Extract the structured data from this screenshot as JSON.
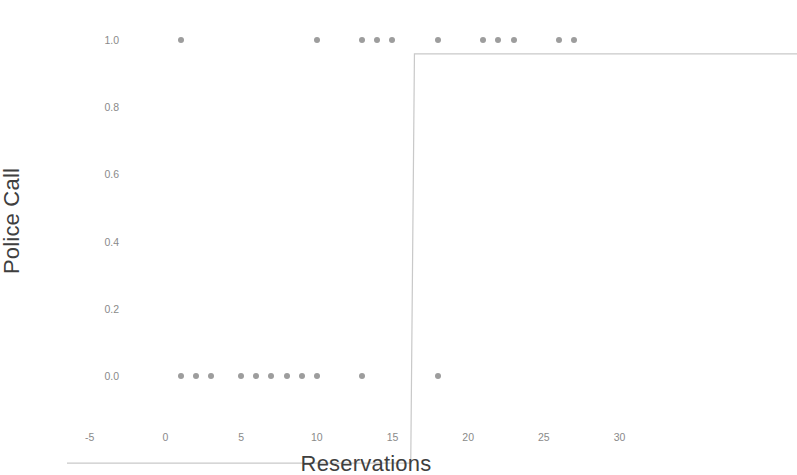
{
  "chart_data": {
    "type": "scatter",
    "title": "",
    "xlabel": "Reservations",
    "ylabel": "Police Call",
    "xlim": [
      -6.5,
      33
    ],
    "ylim": [
      -0.04,
      1.04
    ],
    "xticks": [
      -5,
      0,
      5,
      10,
      15,
      20,
      25,
      30
    ],
    "xtick_labels": [
      "-5",
      "0",
      "5",
      "10",
      "15",
      "20",
      "25",
      "30"
    ],
    "yticks": [
      0.0,
      0.2,
      0.4,
      0.6,
      0.8,
      1.0
    ],
    "ytick_labels": [
      "0.0",
      "0.2",
      "0.4",
      "0.6",
      "0.8",
      "1.0"
    ],
    "grid": false,
    "legend": null,
    "point_color": "#9d9d9d",
    "line_color": "#c9c9c9",
    "series": [
      {
        "name": "Police Call observations",
        "type": "scatter",
        "points": [
          {
            "x": 1,
            "y": 1
          },
          {
            "x": 1,
            "y": 0
          },
          {
            "x": 2,
            "y": 0
          },
          {
            "x": 3,
            "y": 0
          },
          {
            "x": 5,
            "y": 0
          },
          {
            "x": 6,
            "y": 0
          },
          {
            "x": 7,
            "y": 0
          },
          {
            "x": 8,
            "y": 0
          },
          {
            "x": 9,
            "y": 0
          },
          {
            "x": 10,
            "y": 0
          },
          {
            "x": 10,
            "y": 1
          },
          {
            "x": 13,
            "y": 0
          },
          {
            "x": 13,
            "y": 1
          },
          {
            "x": 14,
            "y": 1
          },
          {
            "x": 15,
            "y": 1
          },
          {
            "x": 18,
            "y": 0
          },
          {
            "x": 18,
            "y": 1
          },
          {
            "x": 21,
            "y": 1
          },
          {
            "x": 22,
            "y": 1
          },
          {
            "x": 23,
            "y": 1
          },
          {
            "x": 26,
            "y": 1
          },
          {
            "x": 27,
            "y": 1
          }
        ]
      },
      {
        "name": "Fitted logistic step",
        "type": "line",
        "points": [
          {
            "x": -6.5,
            "y": 0
          },
          {
            "x": 12.1,
            "y": 0
          },
          {
            "x": 12.3,
            "y": 1
          },
          {
            "x": 33,
            "y": 1
          }
        ]
      }
    ]
  }
}
